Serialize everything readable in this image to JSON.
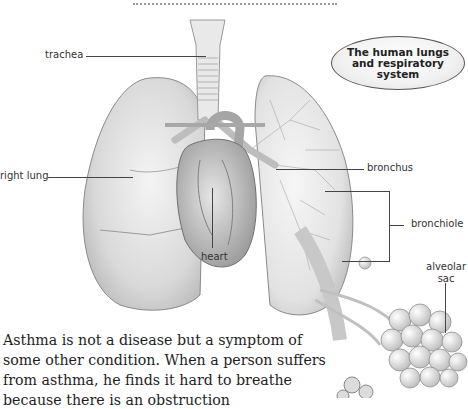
{
  "page": {
    "title_bubble": "The human lungs and respiratory system",
    "labels": {
      "trachea": "trachea",
      "right_lung": "right lung",
      "heart": "heart",
      "bronchus": "bronchus",
      "bronchiole": "bronchiole",
      "alveolar_sac_line1": "alveolar",
      "alveolar_sac_line2": "sac"
    },
    "body_text": "Asthma is not a disease but a symptom of some other condition. When a person suffers from asthma, he finds it hard to breathe because there is an obstruction"
  }
}
